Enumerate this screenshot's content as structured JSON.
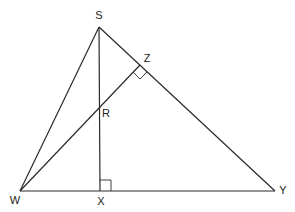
{
  "diagram": {
    "type": "triangle-altitudes",
    "points": {
      "S": {
        "x": 99,
        "y": 27,
        "label": "S",
        "lx": 99,
        "ly": 19
      },
      "Z": {
        "x": 140,
        "y": 65,
        "label": "Z",
        "lx": 147,
        "ly": 62
      },
      "R": {
        "x": 99,
        "y": 106,
        "label": "R",
        "lx": 106,
        "ly": 117
      },
      "W": {
        "x": 20,
        "y": 191,
        "label": "W",
        "lx": 15,
        "ly": 204
      },
      "X": {
        "x": 100,
        "y": 191,
        "label": "X",
        "lx": 101,
        "ly": 205
      },
      "Y": {
        "x": 275,
        "y": 191,
        "label": "Y",
        "lx": 283,
        "ly": 194
      }
    },
    "segments": [
      {
        "from": "S",
        "to": "W"
      },
      {
        "from": "S",
        "to": "Y"
      },
      {
        "from": "W",
        "to": "Y"
      },
      {
        "from": "S",
        "to": "X"
      },
      {
        "from": "W",
        "to": "Z"
      }
    ],
    "right_angles": [
      {
        "at": "Z",
        "between": [
          "ZW",
          "ZY"
        ]
      },
      {
        "at": "X",
        "between": [
          "XS",
          "XY"
        ]
      }
    ]
  }
}
